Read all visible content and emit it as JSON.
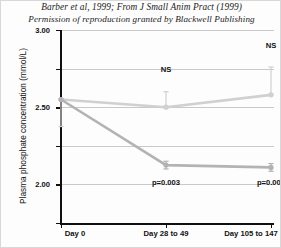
{
  "caption": {
    "line1": "Barber et al, 1999; From J Small Anim Pract (1999)",
    "line2": "Permission of reproduction granted by Blackwell Publishing"
  },
  "chart_data": {
    "type": "line",
    "title": "",
    "xlabel": "",
    "ylabel": "Plasma phosphate concentration (mmol/L)",
    "categories": [
      "Day 0",
      "Day 28 to 49",
      "Day 105 to 147"
    ],
    "ylim": [
      0.5,
      3.0
    ],
    "yticks": [
      "0.50",
      "1.00",
      "1.50",
      "2.00",
      "2.50",
      "3.00"
    ],
    "ytick_values": [
      0.5,
      1.0,
      1.5,
      2.0,
      2.5,
      3.0
    ],
    "grid": true,
    "legend": "none",
    "series": [
      {
        "name": "upper",
        "color": "#d0d0d0",
        "values": [
          2.1,
          2.0,
          2.16
        ],
        "errors_upper": [
          0.0,
          0.2,
          0.36
        ],
        "errors_lower": [
          0.35,
          0.0,
          0.0
        ]
      },
      {
        "name": "lower",
        "color": "#b3b3b3",
        "values": [
          2.1,
          1.25,
          1.22
        ],
        "errors_upper": [
          0.0,
          0.05,
          0.05
        ],
        "errors_lower": [
          0.0,
          0.05,
          0.05
        ]
      }
    ],
    "annotations": [
      {
        "text": "NS",
        "x_index": 1,
        "y": 2.47
      },
      {
        "text": "NS",
        "x_index": 2,
        "y": 2.78
      },
      {
        "text": "p=0.003",
        "x_index": 1,
        "y": 1.0
      },
      {
        "text": "p=0.007",
        "x_index": 2,
        "y": 1.0
      }
    ]
  }
}
